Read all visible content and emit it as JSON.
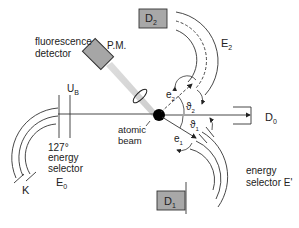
{
  "diagram": {
    "type": "experimental-setup-schematic",
    "labels": {
      "fluorescence": "fluorescence",
      "detector": "detector",
      "pm": "P.M.",
      "d2": "D",
      "d2_sub": "2",
      "e2": "E",
      "e2_sub": "2",
      "ub": "U",
      "ub_sub": "B",
      "e2_small": "e",
      "e2_small_sub": "2",
      "theta2": "ϑ",
      "theta2_sub": "2",
      "theta1": "ϑ",
      "theta1_sub": "1",
      "e1_small": "e",
      "e1_small_sub": "1",
      "d0": "D",
      "d0_sub": "0",
      "atomic": "atomic",
      "beam": "beam",
      "selector_127": "127°",
      "energy": "energy",
      "selector": "selector",
      "e0": "E",
      "e0_sub": "0",
      "k": "K",
      "energy2": "energy",
      "selector_eprime": "selector E'",
      "d1": "D",
      "d1_sub": "1"
    },
    "colors": {
      "line": "#222222",
      "box_fill": "#a8a8a8",
      "cone": "#cfcfcf",
      "target": "#000000"
    }
  }
}
